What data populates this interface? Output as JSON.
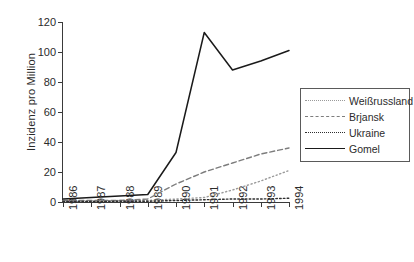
{
  "chart_data": {
    "type": "line",
    "title": "",
    "xlabel": "",
    "ylabel": "Inzidenz pro Million",
    "categories": [
      "1986",
      "1987",
      "1988",
      "1989",
      "1990",
      "1991",
      "1992",
      "1993",
      "1994"
    ],
    "x": [
      1986,
      1987,
      1988,
      1989,
      1990,
      1991,
      1992,
      1993,
      1994
    ],
    "ylim": [
      0,
      120
    ],
    "yticks": [
      0,
      20,
      40,
      60,
      80,
      100,
      120
    ],
    "grid": false,
    "legend_position": "right",
    "series": [
      {
        "name": "Weißrussland",
        "style": "dotted-fine",
        "color": "#9a9a9a",
        "values": [
          0.5,
          0.5,
          1,
          1,
          2,
          3,
          8,
          14,
          21
        ]
      },
      {
        "name": "Brjansk",
        "style": "dashed",
        "color": "#7d7d7d",
        "values": [
          1,
          1,
          1,
          2,
          12,
          20,
          26,
          32,
          36
        ]
      },
      {
        "name": "Ukraine",
        "style": "dotted",
        "color": "#2f2f2f",
        "values": [
          0.3,
          0.3,
          0.5,
          0.5,
          1,
          1.5,
          2,
          2,
          2.5
        ]
      },
      {
        "name": "Gomel",
        "style": "solid",
        "color": "#1a1a1a",
        "values": [
          2,
          3,
          4,
          5,
          33,
          113,
          88,
          94,
          101
        ]
      }
    ]
  },
  "axes": {
    "y_title": "Inzidenz pro Million",
    "y_tick_labels": [
      "0",
      "20",
      "40",
      "60",
      "80",
      "100",
      "120"
    ],
    "x_tick_labels": [
      "1986",
      "1987",
      "1988",
      "1989",
      "1990",
      "1991",
      "1992",
      "1993",
      "1994"
    ]
  },
  "legend": {
    "entries": [
      {
        "label": "Weißrussland"
      },
      {
        "label": "Brjansk"
      },
      {
        "label": "Ukraine"
      },
      {
        "label": "Gomel"
      }
    ]
  }
}
